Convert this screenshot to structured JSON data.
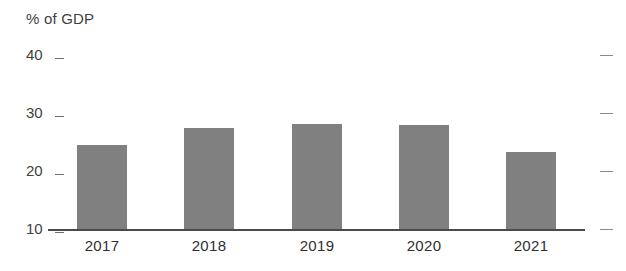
{
  "chart_data": {
    "type": "bar",
    "title": "",
    "ylabel": "% of GDP",
    "xlabel": "",
    "categories": [
      "2017",
      "2018",
      "2019",
      "2020",
      "2021"
    ],
    "values": [
      24.4,
      27.4,
      28.1,
      28.0,
      23.2
    ],
    "ylim": [
      10,
      40
    ],
    "yticks": [
      10,
      20,
      30,
      40
    ],
    "ytick_labels": [
      "10",
      "20",
      "30",
      "40"
    ],
    "grid": false,
    "legend": null,
    "bar_color": "#808080",
    "axis_color": "#4a4a4a",
    "tick_color": "#6e6e6e",
    "right_ticks": [
      10,
      20,
      30,
      40
    ]
  },
  "chart": {
    "unit_label": "% of GDP"
  }
}
